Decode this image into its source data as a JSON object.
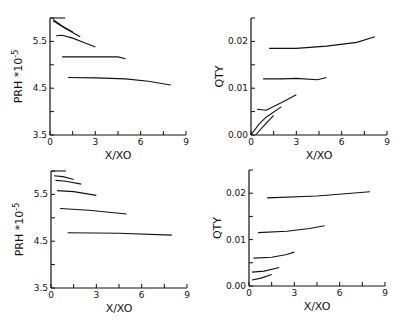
{
  "chart_data": [
    {
      "type": "line",
      "panel": "top-left",
      "xlabel": "X/XO",
      "ylabel": "PRH *10-5",
      "xlim": [
        0,
        9
      ],
      "ylim": [
        3.5,
        6.0
      ],
      "xticks": [
        0,
        3,
        6,
        9
      ],
      "yticks": [
        3.5,
        4.5,
        5.5
      ],
      "yticklabels": [
        "3.5",
        "4.5",
        "5.5"
      ],
      "grid": false,
      "series": [
        {
          "name": "curve-1",
          "x": [
            0,
            1.0
          ],
          "y": [
            6.0,
            6.0
          ]
        },
        {
          "name": "curve-2",
          "x": [
            0.2,
            0.8,
            1.5
          ],
          "y": [
            5.97,
            5.83,
            5.7
          ]
        },
        {
          "name": "curve-3",
          "x": [
            0.2,
            1.0,
            2.0
          ],
          "y": [
            5.94,
            5.78,
            5.6
          ]
        },
        {
          "name": "curve-4",
          "x": [
            0.4,
            0.8,
            1.5,
            2.2,
            3.0
          ],
          "y": [
            5.62,
            5.63,
            5.57,
            5.48,
            5.38
          ]
        },
        {
          "name": "curve-5",
          "x": [
            0.8,
            2.5,
            4.5,
            5.0
          ],
          "y": [
            5.17,
            5.17,
            5.17,
            5.13
          ]
        },
        {
          "name": "curve-6",
          "x": [
            1.2,
            3.0,
            5.0,
            6.5,
            8.0
          ],
          "y": [
            4.73,
            4.72,
            4.7,
            4.65,
            4.57
          ]
        }
      ]
    },
    {
      "type": "line",
      "panel": "top-right",
      "xlabel": "X/XO",
      "ylabel": "QTY",
      "xlim": [
        0,
        9
      ],
      "ylim": [
        0,
        0.025
      ],
      "xticks": [
        0,
        3,
        6,
        9
      ],
      "yticks": [
        0.0,
        0.01,
        0.02
      ],
      "yticklabels": [
        "0.00",
        "0.01",
        "0.02"
      ],
      "grid": false,
      "series": [
        {
          "name": "curve-1",
          "x": [
            1.2,
            3.0,
            5.0,
            7.0,
            8.2
          ],
          "y": [
            0.0185,
            0.0185,
            0.019,
            0.0198,
            0.021
          ]
        },
        {
          "name": "curve-2",
          "x": [
            0.8,
            2.0,
            3.0,
            4.4,
            5.0
          ],
          "y": [
            0.012,
            0.012,
            0.0121,
            0.0118,
            0.0123
          ]
        },
        {
          "name": "curve-3",
          "x": [
            0.4,
            1.0,
            2.0,
            3.0
          ],
          "y": [
            0.0055,
            0.0053,
            0.0069,
            0.0086
          ]
        },
        {
          "name": "curve-4",
          "x": [
            0.0,
            0.5,
            1.0,
            2.0
          ],
          "y": [
            0.0,
            0.0022,
            0.0038,
            0.006
          ]
        },
        {
          "name": "curve-5",
          "x": [
            0.3,
            0.8,
            1.5
          ],
          "y": [
            0.0,
            0.0018,
            0.0042
          ]
        }
      ]
    },
    {
      "type": "line",
      "panel": "bottom-left",
      "xlabel": "X/XO",
      "ylabel": "PRH *10-5",
      "xlim": [
        0,
        9
      ],
      "ylim": [
        3.5,
        6.0
      ],
      "xticks": [
        0,
        3,
        6,
        9
      ],
      "yticks": [
        3.5,
        4.5,
        5.5
      ],
      "yticklabels": [
        "3.5",
        "4.5",
        "5.5"
      ],
      "grid": false,
      "series": [
        {
          "name": "curve-1",
          "x": [
            0,
            1.0
          ],
          "y": [
            6.0,
            6.0
          ]
        },
        {
          "name": "curve-2",
          "x": [
            0.2,
            0.8,
            1.5
          ],
          "y": [
            5.9,
            5.88,
            5.82
          ]
        },
        {
          "name": "curve-3",
          "x": [
            0.3,
            1.0,
            2.0
          ],
          "y": [
            5.8,
            5.78,
            5.72
          ]
        },
        {
          "name": "curve-4",
          "x": [
            0.4,
            1.5,
            3.0
          ],
          "y": [
            5.58,
            5.56,
            5.48
          ]
        },
        {
          "name": "curve-5",
          "x": [
            0.6,
            2.5,
            5.0
          ],
          "y": [
            5.2,
            5.16,
            5.08
          ]
        },
        {
          "name": "curve-6",
          "x": [
            1.1,
            4.5,
            8.0
          ],
          "y": [
            4.68,
            4.67,
            4.63
          ]
        }
      ]
    },
    {
      "type": "line",
      "panel": "bottom-right",
      "xlabel": "X/XO",
      "ylabel": "QTY",
      "xlim": [
        0,
        9
      ],
      "ylim": [
        0,
        0.025
      ],
      "xticks": [
        0,
        3,
        6,
        9
      ],
      "yticks": [
        0.0,
        0.01,
        0.02
      ],
      "yticklabels": [
        "0.00",
        "0.01",
        "0.02"
      ],
      "grid": false,
      "series": [
        {
          "name": "curve-1",
          "x": [
            1.2,
            4.5,
            8.0
          ],
          "y": [
            0.019,
            0.0194,
            0.0203
          ]
        },
        {
          "name": "curve-2",
          "x": [
            0.6,
            2.5,
            4.0,
            5.0
          ],
          "y": [
            0.0115,
            0.0118,
            0.0124,
            0.013
          ]
        },
        {
          "name": "curve-3",
          "x": [
            0.3,
            1.5,
            2.5,
            3.0
          ],
          "y": [
            0.006,
            0.0062,
            0.0068,
            0.0073
          ]
        },
        {
          "name": "curve-4",
          "x": [
            0.2,
            1.0,
            2.0
          ],
          "y": [
            0.003,
            0.0032,
            0.004
          ]
        },
        {
          "name": "curve-5",
          "x": [
            0.2,
            0.8,
            1.5
          ],
          "y": [
            0.0013,
            0.0017,
            0.0025
          ]
        }
      ]
    }
  ],
  "panels": [
    {
      "id": "top-left",
      "xlabel": "X/XO",
      "ylabel": "PRH",
      "ylabel_suffix": "*10",
      "ylabel_exp": "-5"
    },
    {
      "id": "top-right",
      "xlabel": "X/XO",
      "ylabel": "QTY"
    },
    {
      "id": "bottom-left",
      "xlabel": "X/XO",
      "ylabel": "PRH",
      "ylabel_suffix": "*10",
      "ylabel_exp": "-5"
    },
    {
      "id": "bottom-right",
      "xlabel": "X/XO",
      "ylabel": "QTY"
    }
  ]
}
